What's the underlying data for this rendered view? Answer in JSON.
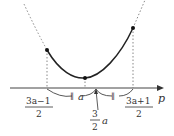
{
  "diagram": {
    "type": "parabola-on-axis",
    "axis_label": "p",
    "curve_points": {
      "left": {
        "label_num": "3a−1",
        "label_den": "2"
      },
      "vertex": {
        "label": "a"
      },
      "right": {
        "label_num": "3a+1",
        "label_den": "2"
      }
    },
    "midpoint": {
      "label_num": "3",
      "label_den": "2",
      "label_var": "a"
    },
    "marks": [
      "∥",
      "∥"
    ],
    "colors": {
      "curve": "#222222",
      "dotted": "#777777",
      "axis": "#333333"
    }
  }
}
